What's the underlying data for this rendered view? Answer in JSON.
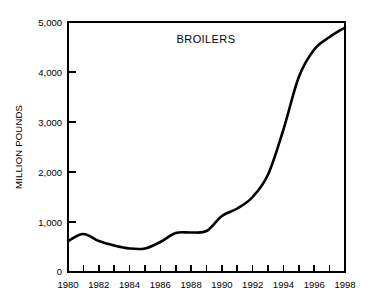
{
  "chart_data": {
    "type": "line",
    "title": "BROILERS",
    "xlabel": "",
    "ylabel": "MILLION POUNDS",
    "xlim": [
      1980,
      1998
    ],
    "ylim": [
      0,
      5000
    ],
    "grid": false,
    "legend": "none",
    "x_tick_labels": [
      "1980",
      "1982",
      "1984",
      "1986",
      "1988",
      "1990",
      "1992",
      "1994",
      "1996",
      "1998"
    ],
    "x_tick_values": [
      1980,
      1982,
      1984,
      1986,
      1988,
      1990,
      1992,
      1994,
      1996,
      1998
    ],
    "x_minor_tick_values": [
      1981,
      1983,
      1985,
      1987,
      1989,
      1991,
      1993,
      1995,
      1997
    ],
    "y_tick_labels": [
      "0",
      "1,000",
      "2,000",
      "3,000",
      "4,000",
      "5,000"
    ],
    "y_tick_values": [
      0,
      1000,
      2000,
      3000,
      4000,
      5000
    ],
    "x": [
      1980,
      1981,
      1982,
      1983,
      1984,
      1985,
      1986,
      1987,
      1988,
      1989,
      1990,
      1991,
      1992,
      1993,
      1994,
      1995,
      1996,
      1997,
      1998
    ],
    "values": [
      620,
      760,
      620,
      530,
      470,
      470,
      600,
      780,
      790,
      820,
      1120,
      1270,
      1500,
      1950,
      2850,
      3900,
      4450,
      4700,
      4890
    ],
    "series": [
      {
        "name": "Broilers",
        "color": "#000000",
        "values": [
          620,
          760,
          620,
          530,
          470,
          470,
          600,
          780,
          790,
          820,
          1120,
          1270,
          1500,
          1950,
          2850,
          3900,
          4450,
          4700,
          4890
        ]
      }
    ]
  },
  "figure": {
    "background_color": "#ffffff",
    "line_color": "#000000",
    "axis_color": "#000000"
  }
}
